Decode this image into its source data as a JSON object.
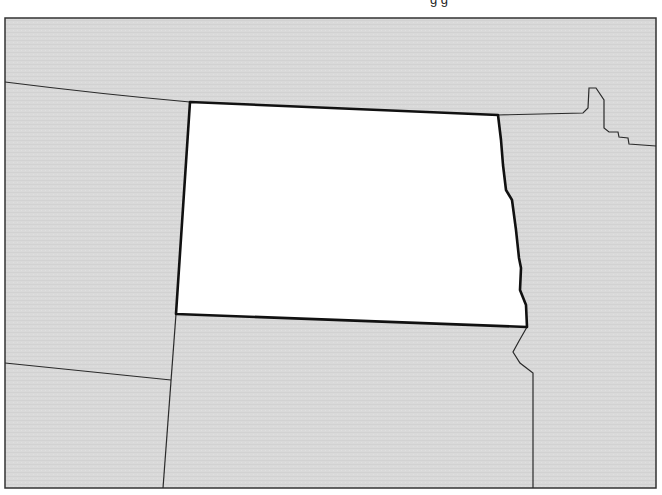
{
  "map": {
    "type": "outline-map",
    "highlighted_region": "North Dakota",
    "colors": {
      "background_land": "#d9d9d9",
      "highlighted_fill": "#ffffff",
      "frame": "#333333",
      "highlighted_border": "#111111",
      "other_borders": "#2a2a2a"
    },
    "caption_fragment": "g        g"
  }
}
